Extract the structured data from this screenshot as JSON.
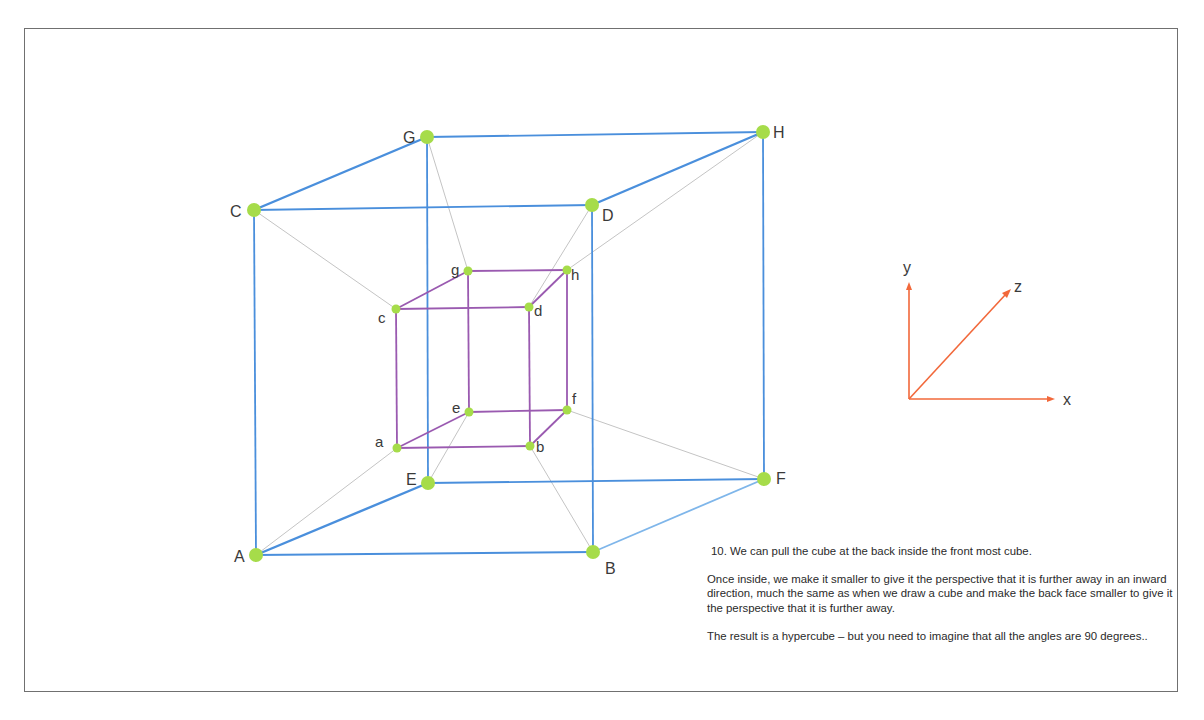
{
  "colors": {
    "outer_cube": "#4a8fdc",
    "outer_cube_light": "#7fb6ea",
    "inner_cube": "#9a5ab0",
    "connector": "#c4c4c4",
    "vertex": "#a6dc4a",
    "axis": "#f2683a",
    "frame": "#707070"
  },
  "outer_cube": {
    "vertices": [
      {
        "label": "A",
        "id": "A"
      },
      {
        "label": "B",
        "id": "B"
      },
      {
        "label": "C",
        "id": "C"
      },
      {
        "label": "D",
        "id": "D"
      },
      {
        "label": "E",
        "id": "E"
      },
      {
        "label": "F",
        "id": "F"
      },
      {
        "label": "G",
        "id": "G"
      },
      {
        "label": "H",
        "id": "H"
      }
    ],
    "edges": [
      [
        "A",
        "B"
      ],
      [
        "A",
        "C"
      ],
      [
        "B",
        "D"
      ],
      [
        "C",
        "D"
      ],
      [
        "E",
        "F"
      ],
      [
        "E",
        "G"
      ],
      [
        "F",
        "H"
      ],
      [
        "G",
        "H"
      ],
      [
        "A",
        "E"
      ],
      [
        "B",
        "F"
      ],
      [
        "C",
        "G"
      ],
      [
        "D",
        "H"
      ]
    ]
  },
  "inner_cube": {
    "vertices": [
      {
        "label": "a",
        "id": "a"
      },
      {
        "label": "b",
        "id": "b"
      },
      {
        "label": "c",
        "id": "c"
      },
      {
        "label": "d",
        "id": "d"
      },
      {
        "label": "e",
        "id": "e"
      },
      {
        "label": "f",
        "id": "f"
      },
      {
        "label": "g",
        "id": "g"
      },
      {
        "label": "h",
        "id": "h"
      }
    ],
    "edges": [
      [
        "a",
        "b"
      ],
      [
        "a",
        "c"
      ],
      [
        "b",
        "d"
      ],
      [
        "c",
        "d"
      ],
      [
        "e",
        "f"
      ],
      [
        "e",
        "g"
      ],
      [
        "f",
        "h"
      ],
      [
        "g",
        "h"
      ],
      [
        "a",
        "e"
      ],
      [
        "b",
        "f"
      ],
      [
        "c",
        "g"
      ],
      [
        "d",
        "h"
      ]
    ]
  },
  "connectors": [
    [
      "A",
      "a"
    ],
    [
      "B",
      "b"
    ],
    [
      "C",
      "c"
    ],
    [
      "D",
      "d"
    ],
    [
      "E",
      "e"
    ],
    [
      "F",
      "f"
    ],
    [
      "G",
      "g"
    ],
    [
      "H",
      "h"
    ]
  ],
  "axes": {
    "labels": {
      "x": "x",
      "y": "y",
      "z": "z"
    }
  },
  "caption": {
    "step": "10. We can pull the cube at the back inside the front most cube.",
    "paragraph1": "Once inside, we make it smaller to give it the perspective that it is further away in an inward direction, much the same as when we draw a cube and make the back face smaller to give it the perspective that it is further away.",
    "paragraph2": "The result is a hypercube – but you need to imagine that all the angles are 90 degrees.."
  }
}
